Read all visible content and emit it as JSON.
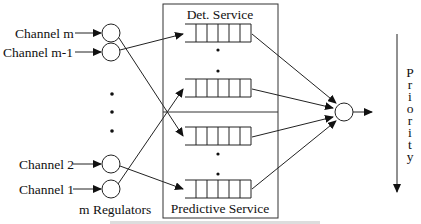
{
  "diagram": {
    "channels": [
      {
        "label": "Channel m",
        "y": 33
      },
      {
        "label": "Channel m-1",
        "y": 52
      },
      {
        "label": "Channel 2",
        "y": 164
      },
      {
        "label": "Channel 1",
        "y": 189
      }
    ],
    "regulators_label": "m Regulators",
    "service_box": {
      "top_label": "Det. Service",
      "bottom_label": "Predictive Service"
    },
    "queues": [
      {
        "group": "deterministic",
        "y": 24
      },
      {
        "group": "deterministic",
        "y": 79
      },
      {
        "group": "predictive",
        "y": 127
      },
      {
        "group": "predictive",
        "y": 180
      }
    ],
    "queue_cells": 6,
    "priority_label": "Priority",
    "priority_letters": [
      "P",
      "r",
      "i",
      "o",
      "r",
      "i",
      "t",
      "y"
    ],
    "caption": "Figure ... (caption cut off at bottom edge)"
  }
}
